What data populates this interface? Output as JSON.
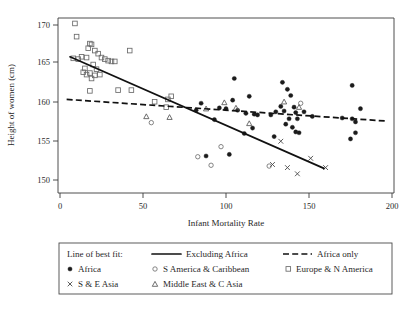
{
  "chart_data": {
    "type": "scatter",
    "title": "",
    "xlabel": "Infant Mortality Rate",
    "ylabel": "Height of women (cm)",
    "xlim": [
      0,
      200
    ],
    "ylim": [
      149,
      171
    ],
    "xticks": [
      0,
      50,
      100,
      150,
      200
    ],
    "yticks": [
      150,
      155,
      160,
      165,
      170
    ],
    "grid": false,
    "legend_position": "below-plot",
    "series": [
      {
        "name": "Africa",
        "marker": "filled-circle",
        "color": "#1b1b1b",
        "points": [
          [
            105,
            163.1
          ],
          [
            134,
            162.6
          ],
          [
            176,
            162.2
          ],
          [
            137,
            161.7
          ],
          [
            139,
            160.9
          ],
          [
            114,
            160.8
          ],
          [
            104,
            160.3
          ],
          [
            85,
            159.9
          ],
          [
            133,
            159.5
          ],
          [
            141,
            159.4
          ],
          [
            181,
            159.2
          ],
          [
            82,
            159.0
          ],
          [
            96,
            159.3
          ],
          [
            100,
            159.2
          ],
          [
            107,
            159.0
          ],
          [
            119,
            158.4
          ],
          [
            127,
            158.4
          ],
          [
            130,
            158.8
          ],
          [
            135,
            158.9
          ],
          [
            142,
            158.7
          ],
          [
            147,
            158.8
          ],
          [
            152,
            158.2
          ],
          [
            170,
            158.0
          ],
          [
            176,
            157.9
          ],
          [
            112,
            158.6
          ],
          [
            117,
            158.5
          ],
          [
            138,
            157.9
          ],
          [
            143,
            157.9
          ],
          [
            136,
            157.2
          ],
          [
            178,
            157.5
          ],
          [
            93,
            157.8
          ],
          [
            116,
            156.7
          ],
          [
            140,
            156.8
          ],
          [
            142,
            156.2
          ],
          [
            144,
            156.1
          ],
          [
            111,
            156.0
          ],
          [
            129,
            155.6
          ],
          [
            178,
            156.1
          ],
          [
            175,
            155.3
          ],
          [
            102,
            153.3
          ],
          [
            88,
            153.1
          ]
        ]
      },
      {
        "name": "S America & Caribbean",
        "marker": "open-circle",
        "color": "#6f6f6f",
        "points": [
          [
            145,
            159.9
          ],
          [
            55,
            157.4
          ],
          [
            97,
            154.3
          ],
          [
            83,
            153.0
          ],
          [
            91,
            151.9
          ],
          [
            126,
            151.8
          ]
        ]
      },
      {
        "name": "Europe & N America",
        "marker": "open-square",
        "color": "#6a6a6a",
        "points": [
          [
            9,
            170.2
          ],
          [
            10,
            168.5
          ],
          [
            18,
            167.6
          ],
          [
            19,
            167.5
          ],
          [
            17,
            167.0
          ],
          [
            21,
            166.7
          ],
          [
            42,
            166.7
          ],
          [
            23,
            166.3
          ],
          [
            13,
            165.9
          ],
          [
            16,
            165.8
          ],
          [
            8,
            165.7
          ],
          [
            11,
            165.6
          ],
          [
            25,
            165.8
          ],
          [
            27,
            165.6
          ],
          [
            29,
            165.4
          ],
          [
            31,
            165.3
          ],
          [
            33,
            165.3
          ],
          [
            20,
            164.9
          ],
          [
            15,
            164.4
          ],
          [
            22,
            164.3
          ],
          [
            14,
            163.9
          ],
          [
            18,
            163.8
          ],
          [
            16,
            163.6
          ],
          [
            21,
            163.5
          ],
          [
            24,
            163.6
          ],
          [
            19,
            163.1
          ],
          [
            18,
            161.5
          ],
          [
            35,
            161.6
          ],
          [
            43,
            161.6
          ],
          [
            57,
            160.1
          ],
          [
            65,
            160.4
          ],
          [
            67,
            160.8
          ],
          [
            64,
            159.4
          ]
        ]
      },
      {
        "name": "S & E Asia",
        "marker": "cross",
        "color": "#4a4a4a",
        "points": [
          [
            133,
            155.0
          ],
          [
            128,
            152.0
          ],
          [
            137,
            151.6
          ],
          [
            151,
            152.8
          ],
          [
            160,
            151.6
          ],
          [
            143,
            150.8
          ]
        ]
      },
      {
        "name": "Middle East & C Asia",
        "marker": "open-triangle",
        "color": "#555555",
        "points": [
          [
            99,
            160.0
          ],
          [
            106,
            159.3
          ],
          [
            135,
            160.1
          ],
          [
            144,
            159.4
          ],
          [
            88,
            159.2
          ],
          [
            52,
            158.2
          ],
          [
            66,
            158.1
          ],
          [
            114,
            157.3
          ]
        ]
      }
    ],
    "fit_lines": [
      {
        "name": "Excluding Africa",
        "style": "solid",
        "x0": 6,
        "y0": 165.9,
        "x1": 159,
        "y1": 151.5
      },
      {
        "name": "Africa only",
        "style": "dashed",
        "x0": 4,
        "y0": 160.4,
        "x1": 197,
        "y1": 157.6
      }
    ]
  },
  "axes": {
    "x_title": "Infant Mortality Rate",
    "y_title": "Height of women (cm)",
    "x_tick_labels": [
      "0",
      "50",
      "100",
      "150",
      "200"
    ],
    "y_tick_labels": [
      "150",
      "155",
      "160",
      "165",
      "170"
    ]
  },
  "legend": {
    "fit_heading": "Line of best fit:",
    "entries": [
      {
        "label": "Excluding Africa",
        "marker": "solid-line"
      },
      {
        "label": "Africa only",
        "marker": "dashed-line"
      },
      {
        "label": "Africa",
        "marker": "filled-circle"
      },
      {
        "label": "S America & Caribbean",
        "marker": "open-circle"
      },
      {
        "label": "Europe & N America",
        "marker": "open-square"
      },
      {
        "label": "S & E Asia",
        "marker": "cross"
      },
      {
        "label": "Middle East & C Asia",
        "marker": "open-triangle"
      }
    ]
  },
  "colors": {
    "axis": "#3a3a3a",
    "text": "#1f1f1f",
    "africa": "#1b1b1b",
    "samerica": "#6f6f6f",
    "europe": "#6a6a6a",
    "asia": "#4a4a4a",
    "mideast": "#555555",
    "fit_line": "#111111"
  }
}
